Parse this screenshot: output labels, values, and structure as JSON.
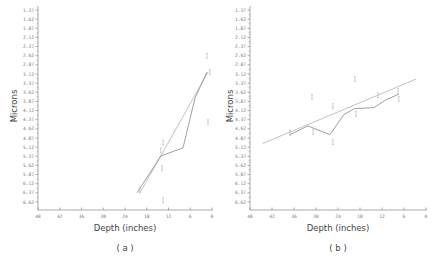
{
  "chart_data": [
    {
      "type": "line",
      "panel": "(a)",
      "caption": "( a )",
      "xlabel": "Depth (inches)",
      "ylabel": "Microns",
      "x_ticks": [
        "48",
        "42",
        "36",
        "30",
        "24",
        "18",
        "12",
        "6",
        "0"
      ],
      "y_ticks": [
        "1.37",
        "1.62",
        "1.87",
        "2.12",
        "2.37",
        "2.62",
        "2.87",
        "3.12",
        "3.37",
        "3.62",
        "3.87",
        "4.12",
        "4.37",
        "4.62",
        "4.87",
        "5.12",
        "5.37",
        "5.62",
        "5.87",
        "6.12",
        "6.37",
        "6.62"
      ],
      "xlim": [
        48,
        0
      ],
      "ylim": [
        6.62,
        1.37
      ],
      "y_inverted": true,
      "series": [
        {
          "name": "observed",
          "style": "jagged",
          "x": [
            20.7,
            14.1,
            8.0,
            4.7,
            1.4
          ],
          "y": [
            6.37,
            5.36,
            5.14,
            3.78,
            3.07
          ]
        },
        {
          "name": "fit",
          "style": "regression",
          "x": [
            19.9,
            1.1
          ],
          "y": [
            6.37,
            3.07
          ]
        }
      ],
      "error_markers": {
        "x": [
          1.4,
          0.6,
          13.5,
          1.1,
          14.1,
          13.8,
          19.9,
          13.5
        ],
        "y": [
          2.62,
          3.07,
          5.0,
          4.44,
          5.21,
          5.7,
          6.29,
          6.57
        ]
      },
      "grid": false
    },
    {
      "type": "line",
      "panel": "(b)",
      "caption": "( b )",
      "xlabel": "Depth (inches)",
      "ylabel": "Microns",
      "x_ticks": [
        "48",
        "42",
        "36",
        "30",
        "24",
        "18",
        "12",
        "6",
        "0"
      ],
      "y_ticks": [
        "1.37",
        "1.62",
        "1.87",
        "2.12",
        "2.37",
        "2.62",
        "2.87",
        "3.12",
        "3.37",
        "3.62",
        "3.87",
        "4.12",
        "4.37",
        "4.62",
        "4.87",
        "5.12",
        "5.37",
        "5.62",
        "5.87",
        "6.12",
        "6.37",
        "6.62"
      ],
      "xlim": [
        48,
        0
      ],
      "ylim": [
        6.62,
        1.37
      ],
      "y_inverted": true,
      "series": [
        {
          "name": "observed",
          "style": "jagged",
          "x": [
            37.1,
            32.2,
            26.2,
            22.4,
            19.6,
            14.2,
            11.0,
            7.4
          ],
          "y": [
            4.78,
            4.54,
            4.78,
            4.23,
            4.07,
            4.04,
            3.83,
            3.67
          ]
        },
        {
          "name": "fit",
          "style": "regression",
          "x": [
            44.5,
            2.7
          ],
          "y": [
            5.02,
            3.26
          ]
        }
      ],
      "error_markers": {
        "x": [
          37.1,
          31.1,
          30.8,
          25.4,
          25.4,
          19.4,
          19.1,
          13.1,
          7.6,
          7.4
        ],
        "y": [
          4.73,
          3.75,
          4.7,
          4.98,
          4.0,
          3.26,
          4.21,
          3.7,
          3.59,
          3.8
        ]
      },
      "grid": false
    }
  ],
  "labels": {
    "a": {
      "xlabel": "Depth (inches)",
      "ylabel": "Microns",
      "caption": "( a )"
    },
    "b": {
      "xlabel": "Depth (inches)",
      "ylabel": "Microns",
      "caption": "( b )"
    }
  }
}
